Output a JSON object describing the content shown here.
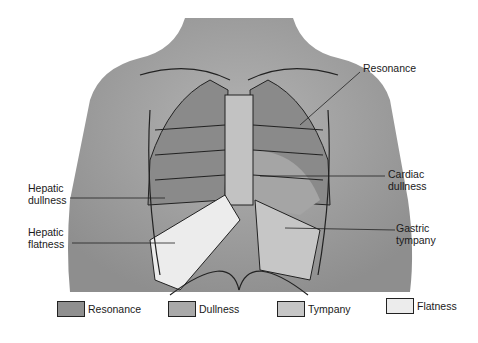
{
  "diagram": {
    "labels": {
      "resonance": "Resonance",
      "cardiac_line1": "Cardiac",
      "cardiac_line2": "dullness",
      "gastric_line1": "Gastric",
      "gastric_line2": "tympany",
      "hepatic_dull_line1": "Hepatic",
      "hepatic_dull_line2": "dullness",
      "hepatic_flat_line1": "Hepatic",
      "hepatic_flat_line2": "flatness"
    }
  },
  "legend": {
    "items": [
      {
        "label": "Resonance",
        "color": "#8f8f8f"
      },
      {
        "label": "Dullness",
        "color": "#a9a9a9"
      },
      {
        "label": "Tympany",
        "color": "#c6c6c6"
      },
      {
        "label": "Flatness",
        "color": "#ececec"
      }
    ]
  },
  "colors": {
    "body": "#a8a8a8",
    "background": "#ffffff",
    "outline": "#222222"
  }
}
